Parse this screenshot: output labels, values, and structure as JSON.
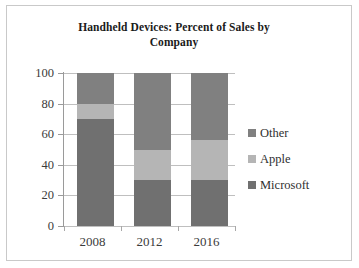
{
  "chart_data": {
    "type": "bar",
    "subtype": "stacked-bar",
    "title": "Handheld Devices: Percent of Sales by Company",
    "title_lines": [
      "Handheld Devices: Percent of Sales by",
      "Company"
    ],
    "xlabel": "",
    "ylabel": "",
    "categories": [
      "2008",
      "2012",
      "2016"
    ],
    "ylim": [
      0,
      100
    ],
    "yticks": [
      100,
      80,
      60,
      40,
      20,
      0
    ],
    "ytick_labels": [
      "100",
      "80",
      "60",
      "40",
      "20",
      "0"
    ],
    "grid": true,
    "legend_position": "right",
    "stack_order_bottom_to_top": [
      "Microsoft",
      "Apple",
      "Other"
    ],
    "series": [
      {
        "name": "Other",
        "color": "#808080",
        "values": [
          20,
          50,
          44
        ]
      },
      {
        "name": "Apple",
        "color": "#b5b5b5",
        "values": [
          10,
          20,
          26
        ]
      },
      {
        "name": "Microsoft",
        "color": "#707070",
        "values": [
          70,
          30,
          30
        ]
      }
    ],
    "stacked_boundaries": {
      "2008": {
        "microsoft": [
          0,
          70
        ],
        "apple": [
          70,
          80
        ],
        "other": [
          80,
          100
        ]
      },
      "2012": {
        "microsoft": [
          0,
          30
        ],
        "apple": [
          30,
          50
        ],
        "other": [
          50,
          100
        ]
      },
      "2016": {
        "microsoft": [
          0,
          30
        ],
        "apple": [
          30,
          56
        ],
        "other": [
          56,
          100
        ]
      }
    }
  },
  "legend": {
    "items": [
      {
        "label": "Other",
        "color": "#808080"
      },
      {
        "label": "Apple",
        "color": "#b5b5b5"
      },
      {
        "label": "Microsoft",
        "color": "#707070"
      }
    ]
  }
}
